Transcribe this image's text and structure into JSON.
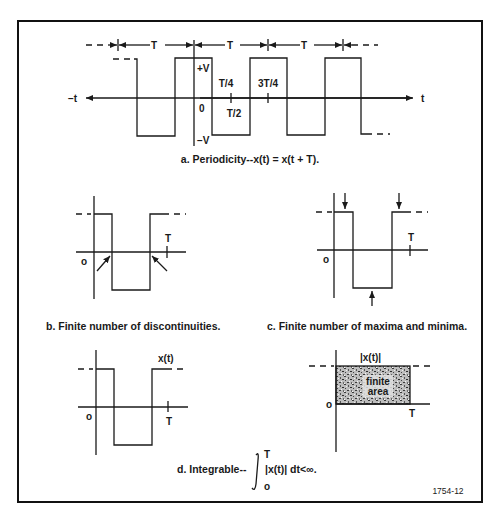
{
  "figure": {
    "id_label": "1754-12",
    "panel_a": {
      "caption": "a. Periodicity--x(t) = x(t + T).",
      "period_label": "T",
      "pos_time_label": "t",
      "neg_time_label": "−t",
      "plus_v": "+V",
      "minus_v": "−V",
      "origin": "0",
      "tick_t4": "T/4",
      "tick_t2": "T/2",
      "tick_3t4": "3T/4"
    },
    "panel_b": {
      "caption": "b. Finite number of discontinuities.",
      "origin": "o",
      "period_label": "T"
    },
    "panel_c": {
      "caption": "c. Finite number of maxima and minima.",
      "origin": "o",
      "period_label": "T"
    },
    "panel_d": {
      "caption_prefix": "d. Integrable--",
      "integral_upper": "T",
      "integral_lower": "o",
      "integrand": "|x(t)| dt<∞.",
      "left_signal_label": "x(t)",
      "left_origin": "o",
      "left_period": "T",
      "right_signal_label": "|x(t)|",
      "right_origin": "o",
      "right_period": "T",
      "area_line1": "finite",
      "area_line2": "area"
    }
  }
}
